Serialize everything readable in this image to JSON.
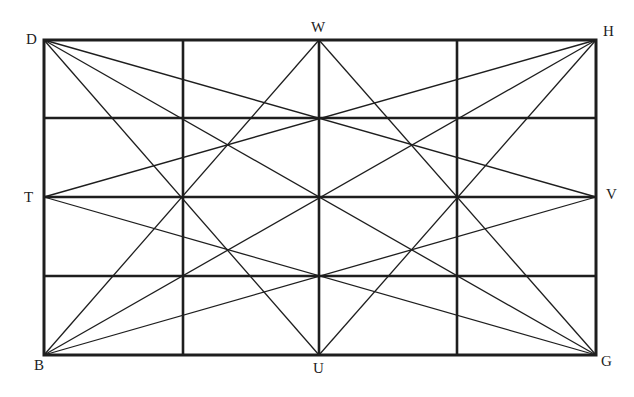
{
  "diagram": {
    "title": "",
    "type": "rectangle grid with diagonals",
    "colors": {
      "line": "#1e1e1e",
      "background": "#ffffff",
      "label": "#222222"
    },
    "rect": {
      "x1": 44,
      "y1": 40,
      "x2": 596,
      "y2": 355
    },
    "grid": {
      "verticals": [
        183,
        319,
        457
      ],
      "horizontals": [
        118,
        197,
        276
      ]
    },
    "points": {
      "D": {
        "x": 44,
        "y": 40,
        "label": "D",
        "lx": 26,
        "ly": 44
      },
      "W": {
        "x": 319,
        "y": 40,
        "label": "W",
        "lx": 311,
        "ly": 32
      },
      "H": {
        "x": 596,
        "y": 40,
        "label": "H",
        "lx": 603,
        "ly": 36
      },
      "T": {
        "x": 44,
        "y": 197,
        "label": "T",
        "lx": 24,
        "ly": 202
      },
      "V": {
        "x": 596,
        "y": 197,
        "label": "V",
        "lx": 606,
        "ly": 199
      },
      "B": {
        "x": 44,
        "y": 355,
        "label": "B",
        "lx": 34,
        "ly": 370
      },
      "U": {
        "x": 319,
        "y": 355,
        "label": "U",
        "lx": 313,
        "ly": 373
      },
      "G": {
        "x": 596,
        "y": 355,
        "label": "G",
        "lx": 601,
        "ly": 366
      }
    },
    "lines": [
      [
        "D",
        "V"
      ],
      [
        "D",
        "G"
      ],
      [
        "D",
        "U"
      ],
      [
        "H",
        "T"
      ],
      [
        "H",
        "B"
      ],
      [
        "H",
        "U"
      ],
      [
        "B",
        "W"
      ],
      [
        "B",
        "V"
      ],
      [
        "G",
        "W"
      ],
      [
        "G",
        "T"
      ]
    ]
  }
}
